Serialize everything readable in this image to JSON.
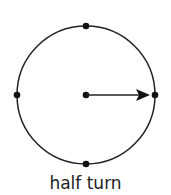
{
  "diagram": {
    "caption": "half turn",
    "circle": {
      "cx": 86,
      "cy": 95,
      "r": 69,
      "stroke": "#222222"
    },
    "dots": [
      {
        "name": "top",
        "x": 86,
        "y": 26
      },
      {
        "name": "right",
        "x": 155,
        "y": 95
      },
      {
        "name": "bottom",
        "x": 86,
        "y": 164
      },
      {
        "name": "left",
        "x": 17,
        "y": 95
      },
      {
        "name": "center",
        "x": 86,
        "y": 95
      }
    ],
    "arrow": {
      "from": [
        86,
        95
      ],
      "to": [
        150,
        95
      ],
      "direction": "right"
    }
  }
}
